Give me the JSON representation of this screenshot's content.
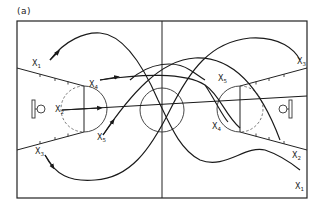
{
  "figure": {
    "panel_label": "(a)",
    "players": [
      {
        "id": "x1",
        "letter": "X",
        "sub": "1"
      },
      {
        "id": "x2",
        "letter": "X",
        "sub": "2"
      },
      {
        "id": "x3",
        "letter": "X",
        "sub": "3"
      },
      {
        "id": "x4",
        "letter": "X",
        "sub": "4"
      },
      {
        "id": "x5",
        "letter": "X",
        "sub": "5"
      }
    ],
    "labels": {
      "x1_top": {
        "letter": "X",
        "sub": "1"
      },
      "x4_left": {
        "letter": "X",
        "sub": "4"
      },
      "x2_left": {
        "letter": "X",
        "sub": "2"
      },
      "x5_left": {
        "letter": "X",
        "sub": "5"
      },
      "x3_left": {
        "letter": "X",
        "sub": "3"
      },
      "x5_right": {
        "letter": "X",
        "sub": "5"
      },
      "x3_right": {
        "letter": "X",
        "sub": "3"
      },
      "x4_right": {
        "letter": "X",
        "sub": "4"
      },
      "x2_right": {
        "letter": "X",
        "sub": "2"
      },
      "x1_right": {
        "letter": "X",
        "sub": "1"
      }
    }
  }
}
